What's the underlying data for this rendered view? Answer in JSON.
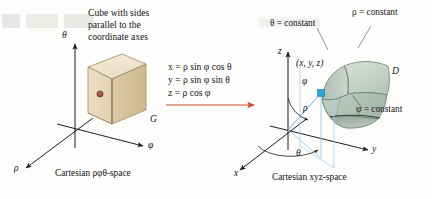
{
  "figure": {
    "title_left_block": "Cube with sides\nparallel to the\ncoordinate axes",
    "heading_line_1": "Cube with sides",
    "heading_line_2": "parallel to the",
    "heading_line_3": "coordinate axes"
  },
  "left_panel": {
    "caption": "Cartesian ρφθ-space",
    "axes": [
      {
        "name": "theta-axis",
        "label": "θ",
        "direction": "up"
      },
      {
        "name": "phi-axis",
        "label": "φ",
        "direction": "lower-right"
      },
      {
        "name": "rho-axis",
        "label": "ρ",
        "direction": "lower-left"
      }
    ],
    "solid_label": "G",
    "solid_description": "tan cube",
    "colors": {
      "cube_top": "#f0e6d0",
      "cube_front": "#e8dbbf",
      "cube_side": "#d9c7a3",
      "cube_edge": "#8a7a5c",
      "center_dot": "#9a4a32"
    }
  },
  "equations": {
    "lines": [
      {
        "lhs": "x",
        "rhs": "ρ sin φ cos θ",
        "full": "x = ρ sin φ cos θ"
      },
      {
        "lhs": "y",
        "rhs": "ρ sin φ sin θ",
        "full": "y = ρ sin φ sin θ"
      },
      {
        "lhs": "z",
        "rhs": "ρ cos φ",
        "full": "z = ρ cos φ"
      }
    ],
    "arrow": {
      "name": "transformation-arrow",
      "color": "#c8502a",
      "direction": "right"
    }
  },
  "right_panel": {
    "caption": "Cartesian xyz-space",
    "axes": [
      {
        "name": "z-axis",
        "label": "z",
        "direction": "up"
      },
      {
        "name": "y-axis",
        "label": "y",
        "direction": "right"
      },
      {
        "name": "x-axis",
        "label": "x",
        "direction": "lower-left"
      }
    ],
    "point_label": "(x, y, z)",
    "radius_label": "ρ",
    "angle_phi_label": "φ",
    "angle_theta_label": "θ",
    "solid_label": "D",
    "annotations": [
      {
        "name": "theta-constant-label",
        "text": "θ = constant"
      },
      {
        "name": "rho-constant-label",
        "text": "ρ = constant"
      },
      {
        "name": "phi-constant-label",
        "text": "φ = constant"
      }
    ],
    "colors": {
      "solid_light": "#cdd8cf",
      "solid_mid": "#b4c4b8",
      "solid_dark": "#9aae9f",
      "solid_edge": "#5d6f63",
      "point_marker": "#2aa8e0",
      "ray": "#7fb8dd",
      "axis": "#1d1d1d"
    }
  }
}
